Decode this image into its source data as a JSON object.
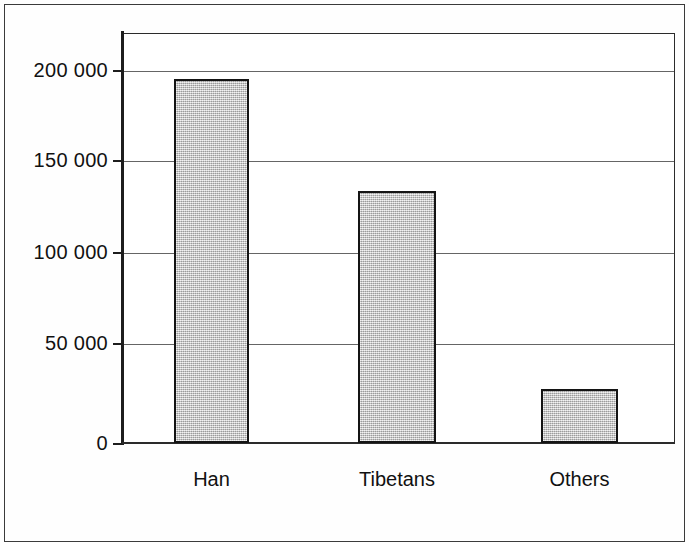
{
  "chart_data": {
    "type": "bar",
    "title": "",
    "subtitle": "",
    "xlabel": "",
    "ylabel": "",
    "categories": [
      "Han",
      "Tibetans",
      "Others"
    ],
    "values": [
      195000,
      135000,
      29000
    ],
    "ylim": [
      0,
      225000
    ],
    "yticks": [
      0,
      50000,
      100000,
      150000,
      200000
    ],
    "ytick_labels": [
      "0",
      "50 000",
      "100 000",
      "150 000",
      "200 000"
    ],
    "grid": true,
    "grid_axis": "y",
    "legend": false,
    "legend_position": "none",
    "bar_fill_color": "#c9c9c9",
    "bar_edge_color": "#141414",
    "axis_color": "#1d1d1d",
    "background_color": "#ffffff",
    "series": [
      {
        "name": "Population",
        "values": [
          195000,
          135000,
          29000
        ]
      }
    ]
  }
}
